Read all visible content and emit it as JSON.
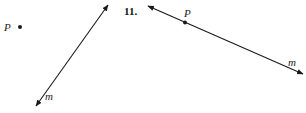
{
  "figure_left": {
    "point_label": "P",
    "line_label": "m"
  },
  "figure_right": {
    "problem_number": "11.",
    "point_label": "P",
    "line_label": "m"
  },
  "colors": {
    "ink": "#1a1a1a",
    "background": "#ffffff"
  }
}
